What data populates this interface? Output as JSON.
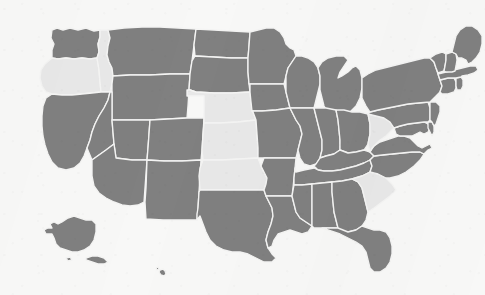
{
  "map": {
    "title": "United States choropleth map",
    "projection": "albers-usa",
    "background_color": "#f8f8f7",
    "border_color": "#f4f4f3",
    "legend_colors": {
      "highlighted": "#808080",
      "unhighlighted": "#e8e8e8"
    },
    "counts": {
      "highlighted": 43,
      "unhighlighted": 7
    },
    "unhighlighted_states": [
      "Oregon",
      "Idaho",
      "Nebraska",
      "Kansas",
      "Oklahoma",
      "West Virginia",
      "South Carolina"
    ],
    "states": [
      {
        "code": "WA",
        "name": "Washington",
        "value": 1,
        "fill": "#808080"
      },
      {
        "code": "OR",
        "name": "Oregon",
        "value": 0,
        "fill": "#e8e8e8"
      },
      {
        "code": "CA",
        "name": "California",
        "value": 1,
        "fill": "#808080"
      },
      {
        "code": "NV",
        "name": "Nevada",
        "value": 1,
        "fill": "#808080"
      },
      {
        "code": "ID",
        "name": "Idaho",
        "value": 0,
        "fill": "#e8e8e8"
      },
      {
        "code": "MT",
        "name": "Montana",
        "value": 1,
        "fill": "#808080"
      },
      {
        "code": "WY",
        "name": "Wyoming",
        "value": 1,
        "fill": "#808080"
      },
      {
        "code": "UT",
        "name": "Utah",
        "value": 1,
        "fill": "#808080"
      },
      {
        "code": "AZ",
        "name": "Arizona",
        "value": 1,
        "fill": "#808080"
      },
      {
        "code": "CO",
        "name": "Colorado",
        "value": 1,
        "fill": "#808080"
      },
      {
        "code": "NM",
        "name": "New Mexico",
        "value": 1,
        "fill": "#808080"
      },
      {
        "code": "ND",
        "name": "North Dakota",
        "value": 1,
        "fill": "#808080"
      },
      {
        "code": "SD",
        "name": "South Dakota",
        "value": 1,
        "fill": "#808080"
      },
      {
        "code": "NE",
        "name": "Nebraska",
        "value": 0,
        "fill": "#e8e8e8"
      },
      {
        "code": "KS",
        "name": "Kansas",
        "value": 0,
        "fill": "#e8e8e8"
      },
      {
        "code": "OK",
        "name": "Oklahoma",
        "value": 0,
        "fill": "#e8e8e8"
      },
      {
        "code": "TX",
        "name": "Texas",
        "value": 1,
        "fill": "#808080"
      },
      {
        "code": "MN",
        "name": "Minnesota",
        "value": 1,
        "fill": "#808080"
      },
      {
        "code": "IA",
        "name": "Iowa",
        "value": 1,
        "fill": "#808080"
      },
      {
        "code": "MO",
        "name": "Missouri",
        "value": 1,
        "fill": "#808080"
      },
      {
        "code": "AR",
        "name": "Arkansas",
        "value": 1,
        "fill": "#808080"
      },
      {
        "code": "LA",
        "name": "Louisiana",
        "value": 1,
        "fill": "#808080"
      },
      {
        "code": "WI",
        "name": "Wisconsin",
        "value": 1,
        "fill": "#808080"
      },
      {
        "code": "IL",
        "name": "Illinois",
        "value": 1,
        "fill": "#808080"
      },
      {
        "code": "MI",
        "name": "Michigan",
        "value": 1,
        "fill": "#808080"
      },
      {
        "code": "IN",
        "name": "Indiana",
        "value": 1,
        "fill": "#808080"
      },
      {
        "code": "OH",
        "name": "Ohio",
        "value": 1,
        "fill": "#808080"
      },
      {
        "code": "KY",
        "name": "Kentucky",
        "value": 1,
        "fill": "#808080"
      },
      {
        "code": "TN",
        "name": "Tennessee",
        "value": 1,
        "fill": "#808080"
      },
      {
        "code": "MS",
        "name": "Mississippi",
        "value": 1,
        "fill": "#808080"
      },
      {
        "code": "AL",
        "name": "Alabama",
        "value": 1,
        "fill": "#808080"
      },
      {
        "code": "GA",
        "name": "Georgia",
        "value": 1,
        "fill": "#808080"
      },
      {
        "code": "FL",
        "name": "Florida",
        "value": 1,
        "fill": "#808080"
      },
      {
        "code": "SC",
        "name": "South Carolina",
        "value": 0,
        "fill": "#e8e8e8"
      },
      {
        "code": "NC",
        "name": "North Carolina",
        "value": 1,
        "fill": "#808080"
      },
      {
        "code": "VA",
        "name": "Virginia",
        "value": 1,
        "fill": "#808080"
      },
      {
        "code": "WV",
        "name": "West Virginia",
        "value": 0,
        "fill": "#e8e8e8"
      },
      {
        "code": "MD",
        "name": "Maryland",
        "value": 1,
        "fill": "#808080"
      },
      {
        "code": "DE",
        "name": "Delaware",
        "value": 1,
        "fill": "#808080"
      },
      {
        "code": "PA",
        "name": "Pennsylvania",
        "value": 1,
        "fill": "#808080"
      },
      {
        "code": "NJ",
        "name": "New Jersey",
        "value": 1,
        "fill": "#808080"
      },
      {
        "code": "NY",
        "name": "New York",
        "value": 1,
        "fill": "#808080"
      },
      {
        "code": "CT",
        "name": "Connecticut",
        "value": 1,
        "fill": "#808080"
      },
      {
        "code": "RI",
        "name": "Rhode Island",
        "value": 1,
        "fill": "#808080"
      },
      {
        "code": "MA",
        "name": "Massachusetts",
        "value": 1,
        "fill": "#808080"
      },
      {
        "code": "VT",
        "name": "Vermont",
        "value": 1,
        "fill": "#808080"
      },
      {
        "code": "NH",
        "name": "New Hampshire",
        "value": 1,
        "fill": "#808080"
      },
      {
        "code": "ME",
        "name": "Maine",
        "value": 1,
        "fill": "#808080"
      },
      {
        "code": "AK",
        "name": "Alaska",
        "value": 1,
        "fill": "#808080"
      },
      {
        "code": "HI",
        "name": "Hawaii",
        "value": 1,
        "fill": "#808080"
      }
    ]
  }
}
